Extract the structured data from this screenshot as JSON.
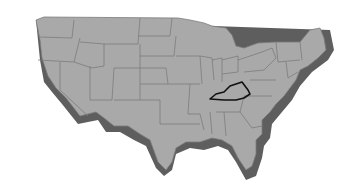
{
  "map": {
    "title": "United States",
    "highlighted_state": "Kentucky",
    "colors": {
      "background": "#ffffff",
      "land": "#a9a9a9",
      "shadow": "#5e5e5e",
      "state_border": "#7c7c7c",
      "highlight_border": "#111111"
    }
  }
}
